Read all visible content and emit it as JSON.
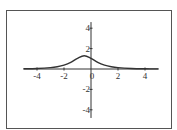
{
  "chart_data": {
    "type": "line",
    "title": "",
    "xlabel": "",
    "ylabel": "",
    "xlim": [
      -5,
      5
    ],
    "ylim": [
      -5,
      5
    ],
    "grid": false,
    "legend": null,
    "x_ticks": [
      -4,
      -2,
      0,
      2,
      4
    ],
    "y_ticks": [
      -4,
      -2,
      2,
      4
    ],
    "x_tick_labels": [
      "-4",
      "-2",
      "0",
      "2",
      "4"
    ],
    "y_tick_labels": [
      "-4",
      "-2",
      "2",
      "4"
    ],
    "series": [
      {
        "name": "f(x)",
        "color": "#333333",
        "x": [
          -5,
          -4,
          -3,
          -2.5,
          -2,
          -1.5,
          -1,
          -0.5,
          0,
          0.5,
          1,
          1.5,
          2,
          3,
          4,
          5
        ],
        "y": [
          0.02,
          0.05,
          0.13,
          0.22,
          0.38,
          0.65,
          1.05,
          1.3,
          1.05,
          0.65,
          0.38,
          0.22,
          0.13,
          0.05,
          0.02,
          0.01
        ]
      }
    ]
  },
  "colors": {
    "frame": "#555555",
    "axis": "#333333",
    "curve": "#333333",
    "background": "#ffffff"
  }
}
